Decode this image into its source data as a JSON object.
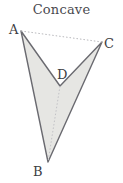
{
  "figure": {
    "title": "Concave",
    "type": "polygon-diagram",
    "background_color": "#ffffff",
    "canvas": {
      "width": 123,
      "height": 183
    }
  },
  "polygon": {
    "name": "concave-quadrilateral",
    "fill_color": "#e6e6e3",
    "stroke_color": "#6a6a70",
    "stroke_width": 1.4,
    "path": "M 21 31 L 60 86 L 102 42 L 48 162 Z",
    "order": [
      "A",
      "D",
      "C",
      "B"
    ]
  },
  "vertices": [
    {
      "id": "A",
      "label": "A",
      "x": 21,
      "y": 31,
      "label_x": 9,
      "label_y": 34
    },
    {
      "id": "C",
      "label": "C",
      "x": 102,
      "y": 42,
      "label_x": 104,
      "label_y": 48
    },
    {
      "id": "D",
      "label": "D",
      "x": 60,
      "y": 86,
      "label_x": 57,
      "label_y": 79
    },
    {
      "id": "B",
      "label": "B",
      "x": 48,
      "y": 162,
      "label_x": 33,
      "label_y": 176
    }
  ],
  "dotted_lines": [
    {
      "id": "A-C",
      "x1": 21,
      "y1": 31,
      "x2": 102,
      "y2": 42,
      "color": "#b9b9bd",
      "dash": "1.5 2"
    },
    {
      "id": "D-B",
      "x1": 60,
      "y1": 86,
      "x2": 48,
      "y2": 162,
      "color": "#c2c2c6",
      "dash": "1.5 2"
    }
  ],
  "colors": {
    "title_text": "#4a4a4f",
    "label_text": "#3d3d42",
    "shape_fill": "#e6e6e3",
    "shape_stroke": "#6a6a70",
    "dotted": "#b9b9bd"
  }
}
